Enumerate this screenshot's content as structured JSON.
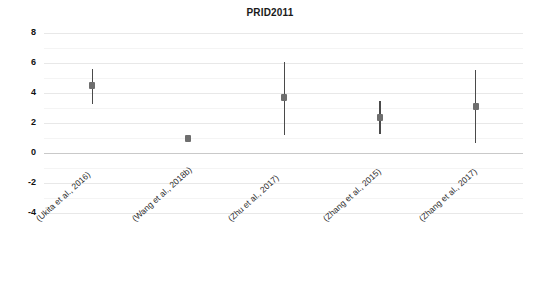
{
  "chart_data": {
    "type": "scatter",
    "title": "PRID2011",
    "xlabel": "",
    "ylabel": "RANK",
    "ylim": [
      -4,
      8
    ],
    "yticks": [
      8,
      6,
      4,
      2,
      0,
      -2,
      -4
    ],
    "grid": true,
    "legend": "none",
    "categories": [
      "(Ukita et al., 2016)",
      "(Wang et al., 2018b)",
      "(Zhu et al., 2017)",
      "(Zhang et al., 2015)",
      "(Zhang et al., 2017)"
    ],
    "series": [
      {
        "name": "RANK",
        "values": [
          4.5,
          1.0,
          3.7,
          2.4,
          3.1
        ],
        "error_low": [
          3.3,
          1.0,
          1.2,
          1.3,
          0.65
        ],
        "error_high": [
          5.6,
          1.0,
          6.1,
          3.5,
          5.55
        ]
      }
    ],
    "marker_color": "#6e6e6e",
    "errorbar_color": "#4a4a4a",
    "gridline_color": "#e8e8e8",
    "axis_color": "#c9c9c9"
  }
}
